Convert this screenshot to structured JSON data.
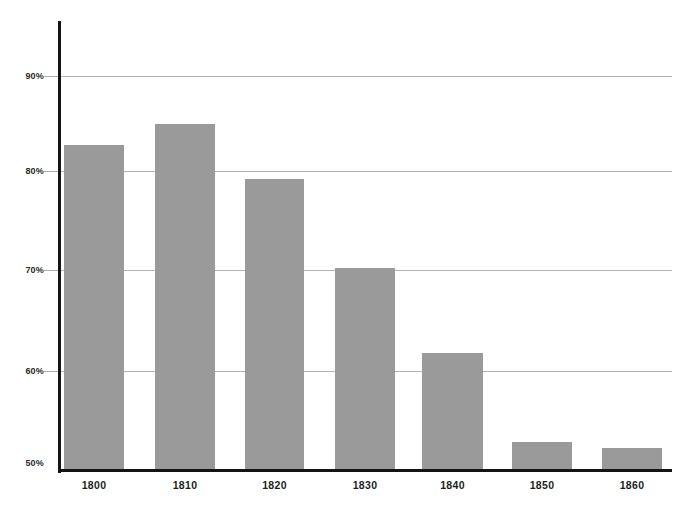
{
  "chart_data": {
    "type": "bar",
    "title": "",
    "subtitle": "",
    "xlabel": "",
    "ylabel": "",
    "categories": [
      "1800",
      "1810",
      "1820",
      "1830",
      "1840",
      "1850",
      "1860"
    ],
    "values": [
      82.6,
      84.7,
      79.2,
      70.3,
      61.7,
      52.8,
      52.2
    ],
    "value_unit": "%",
    "ylim": [
      50,
      93
    ],
    "y_ticks": [
      50,
      60,
      70,
      80,
      90
    ],
    "y_tick_labels": [
      "50%",
      "60%",
      "70%",
      "80%",
      "90%"
    ],
    "grid": true,
    "grid_axis": "y",
    "legend": false,
    "legend_position": "none",
    "series": [
      {
        "name": "",
        "values": [
          82.6,
          84.7,
          79.2,
          70.3,
          61.7,
          52.8,
          52.2
        ]
      }
    ],
    "bars": [
      {
        "category": "1800",
        "value": 82.6,
        "label": "1800"
      },
      {
        "category": "1810",
        "value": 84.7,
        "label": "1810"
      },
      {
        "category": "1820",
        "value": 79.2,
        "label": "1820"
      },
      {
        "category": "1830",
        "value": 70.3,
        "label": "1830"
      },
      {
        "category": "1840",
        "value": 61.7,
        "label": "1840"
      },
      {
        "category": "1850",
        "value": 52.8,
        "label": "1850"
      },
      {
        "category": "1860",
        "value": 52.2,
        "label": "1860"
      }
    ]
  },
  "colors": {
    "bar_fill": "#9a9a9a",
    "axis_line": "#141414",
    "gridline": "#b4b4b4",
    "tick_text": "#1d1d1d",
    "background": "#ffffff"
  },
  "axis": {
    "y_labels": [
      "90%",
      "80%",
      "70%",
      "60%",
      "50%"
    ],
    "x_labels": [
      "1800",
      "1810",
      "1820",
      "1830",
      "1840",
      "1850",
      "1860"
    ]
  }
}
